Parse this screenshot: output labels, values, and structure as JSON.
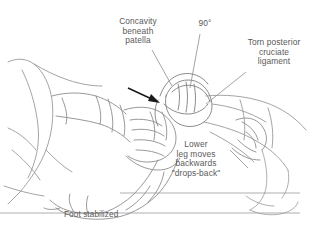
{
  "figure": {
    "background_color": "#ffffff",
    "line_color": "#8d8d8d",
    "text_color": "#5a5a5a",
    "arrow_color": "#1a1a1a"
  },
  "annotations": {
    "concavity": "Concavity\nbeneath\npatella",
    "angle": "90°",
    "torn_ligament": "Torn posterior\ncruciate\nligament",
    "lower_leg": "Lower\nleg moves\nbackwards\n\"drops-back\"",
    "foot": "Foot stabilized"
  }
}
